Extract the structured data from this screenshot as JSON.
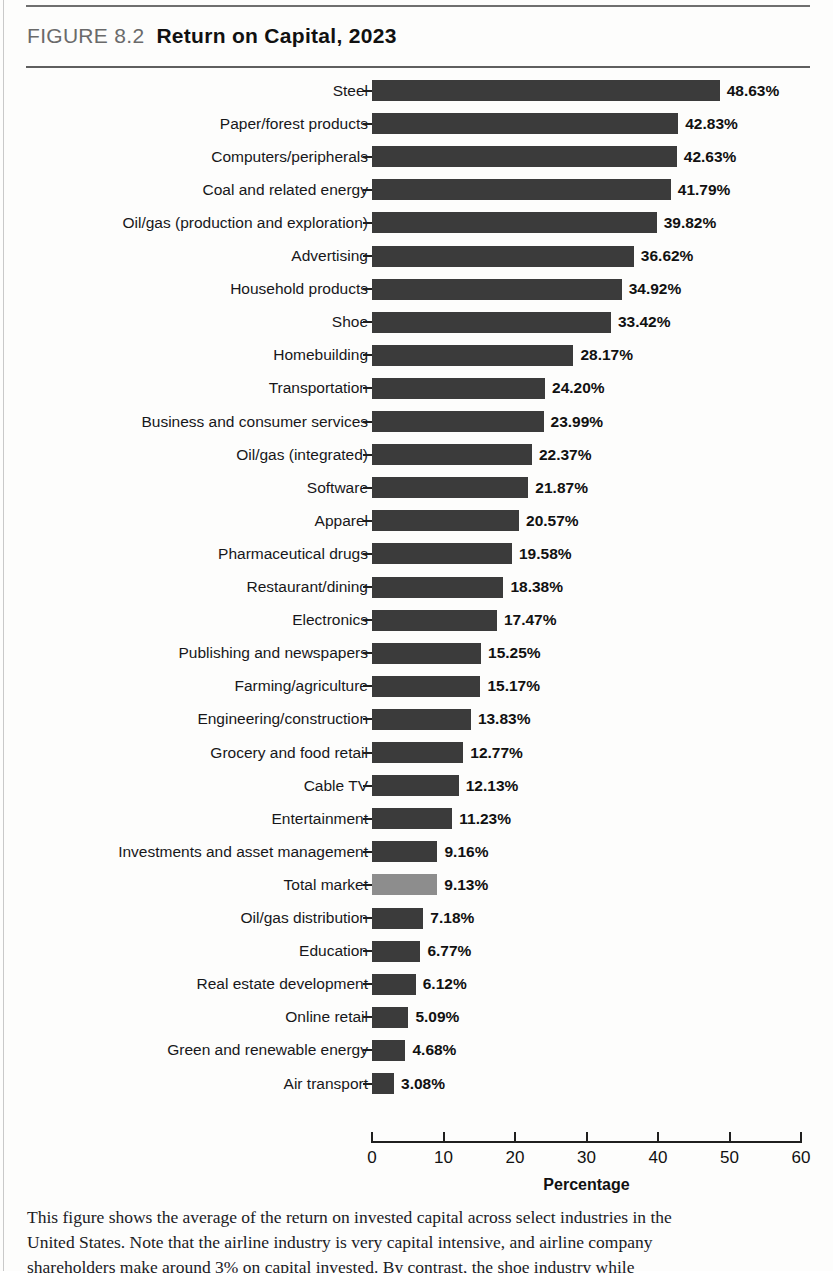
{
  "figure": {
    "number_label": "FIGURE 8.2",
    "title": "Return on Capital, 2023"
  },
  "caption": {
    "line1": "This figure shows the average of the return on invested capital across select industries in the",
    "line2": "United States. Note that the airline industry is very capital intensive, and airline company",
    "line3": "shareholders make around 3% on capital invested. By contrast, the shoe industry while"
  },
  "chart_data": {
    "type": "bar",
    "orientation": "horizontal",
    "title": "Return on Capital, 2023",
    "xlabel": "Percentage",
    "ylabel": "",
    "xlim": [
      0,
      60
    ],
    "xticks": [
      0,
      10,
      20,
      30,
      40,
      50,
      60
    ],
    "xtick_labels": [
      "0",
      "10",
      "20",
      "30",
      "40",
      "50",
      "60"
    ],
    "grid": false,
    "legend": "none",
    "bar_color": "#3b3b3b",
    "highlight_color": "#8d8d8d",
    "highlight_category": "Total market",
    "value_suffix": "%",
    "categories": [
      "Steel",
      "Paper/forest products",
      "Computers/peripherals",
      "Coal and related energy",
      "Oil/gas (production and exploration)",
      "Advertising",
      "Household products",
      "Shoe",
      "Homebuilding",
      "Transportation",
      "Business and consumer services",
      "Oil/gas (integrated)",
      "Software",
      "Apparel",
      "Pharmaceutical drugs",
      "Restaurant/dining",
      "Electronics",
      "Publishing and newspapers",
      "Farming/agriculture",
      "Engineering/construction",
      "Grocery and food retail",
      "Cable TV",
      "Entertainment",
      "Investments and asset management",
      "Total market",
      "Oil/gas distribution",
      "Education",
      "Real estate development",
      "Online retail",
      "Green and renewable energy",
      "Air transport"
    ],
    "values": [
      48.63,
      42.83,
      42.63,
      41.79,
      39.82,
      36.62,
      34.92,
      33.42,
      28.17,
      24.2,
      23.99,
      22.37,
      21.87,
      20.57,
      19.58,
      18.38,
      17.47,
      15.25,
      15.17,
      13.83,
      12.77,
      12.13,
      11.23,
      9.16,
      9.13,
      7.18,
      6.77,
      6.12,
      5.09,
      4.68,
      3.08
    ],
    "value_labels": [
      "48.63%",
      "42.83%",
      "42.63%",
      "41.79%",
      "39.82%",
      "36.62%",
      "34.92%",
      "33.42%",
      "28.17%",
      "24.20%",
      "23.99%",
      "22.37%",
      "21.87%",
      "20.57%",
      "19.58%",
      "18.38%",
      "17.47%",
      "15.25%",
      "15.17%",
      "13.83%",
      "12.77%",
      "12.13%",
      "11.23%",
      "9.16%",
      "9.13%",
      "7.18%",
      "6.77%",
      "6.12%",
      "5.09%",
      "4.68%",
      "3.08%"
    ]
  }
}
